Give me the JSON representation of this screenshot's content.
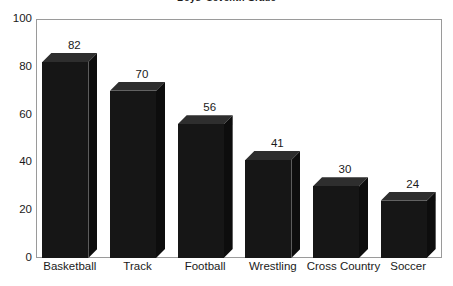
{
  "chart_data": {
    "type": "bar",
    "title": "Boys' Seventh Grade",
    "xlabel": "",
    "ylabel": "",
    "categories": [
      "Basketball",
      "Track",
      "Football",
      "Wrestling",
      "Cross Country",
      "Soccer"
    ],
    "values": [
      82,
      70,
      56,
      41,
      30,
      24
    ],
    "value_labels": [
      "82",
      "70",
      "56",
      "41",
      "30",
      "24"
    ],
    "ylim": [
      0,
      100
    ],
    "ytick_labels": [
      "0",
      "20",
      "40",
      "60",
      "80",
      "100"
    ],
    "ytick_values": [
      0,
      20,
      40,
      60,
      80,
      100
    ],
    "grid": false,
    "legend": false,
    "style": "3d-column",
    "colors": {
      "bar_front": "#161616",
      "bar_top": "#2e2e2e",
      "bar_side": "#0d0d0d",
      "frame": "#9a9a9a",
      "text": "#1a1a1a",
      "background": "#ffffff"
    }
  }
}
